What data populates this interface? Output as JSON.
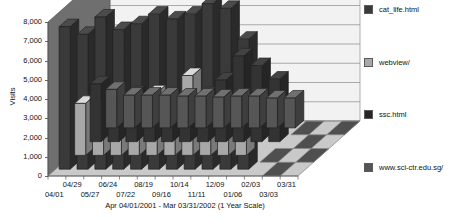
{
  "chart_data": {
    "type": "bar",
    "title": "Top Documents",
    "xlabel": "Apr 04/01/2001 - Mar 03/31/2002 (1 Year Scale)",
    "ylabel": "Visits",
    "ylim": [
      0,
      8000
    ],
    "yticks": [
      "0",
      "1,000",
      "2,000",
      "3,000",
      "4,000",
      "5,000",
      "6,000",
      "7,000",
      "8,000"
    ],
    "ytick_values": [
      0,
      1000,
      2000,
      3000,
      4000,
      5000,
      6000,
      7000,
      8000
    ],
    "grid": true,
    "legend_position": "right",
    "projection": "3d",
    "categories": [
      "04/01",
      "04/29",
      "05/27",
      "06/24",
      "07/22",
      "08/19",
      "09/16",
      "10/14",
      "11/11",
      "12/09",
      "01/06",
      "02/03",
      "03/03",
      "03/31"
    ],
    "categories_upper": [
      "04/29",
      "06/24",
      "08/19",
      "10/14",
      "12/09",
      "02/03",
      "03/31"
    ],
    "categories_lower": [
      "04/01",
      "05/27",
      "07/22",
      "09/16",
      "11/11",
      "01/06",
      "03/03"
    ],
    "series": [
      {
        "name": "cat_life.html",
        "color": "#3a3a3a",
        "values": [
          7400,
          7000,
          7900,
          7250,
          7550,
          8050,
          7800,
          8050,
          8600,
          8350,
          6750,
          0,
          0,
          0
        ]
      },
      {
        "name": "webview/",
        "color": "#a8a8a8",
        "values": [
          2700,
          2450,
          2300,
          2300,
          3250,
          2750,
          4150,
          2500,
          2800,
          1800,
          0,
          0,
          0,
          0
        ]
      },
      {
        "name": "ssc.html",
        "color": "#333333",
        "values": [
          3000,
          2050,
          2500,
          2100,
          2100,
          2100,
          2450,
          3200,
          4450,
          3950,
          3250,
          0,
          0,
          0
        ]
      },
      {
        "name": "www.sci-ctr.edu.sg/",
        "color": "#565656",
        "values": [
          2000,
          1700,
          1700,
          1700,
          1650,
          1650,
          1600,
          1650,
          1650,
          1550,
          1550,
          0,
          0,
          0
        ]
      }
    ]
  },
  "legend": {
    "items": [
      {
        "label": "cat_life.html",
        "color": "#3a3a3a"
      },
      {
        "label": "webview/",
        "color": "#a8a8a8"
      },
      {
        "label": "ssc.html",
        "color": "#262626"
      },
      {
        "label": "www.sci-ctr.edu.sg/",
        "color": "#555555"
      }
    ]
  },
  "style": {
    "wall_color": "#f2f2f2",
    "floor_color": "#c9c9c9",
    "left_wall_color": "#6f6f6f",
    "grid_color": "#8a8a8a",
    "axis_color": "#555555"
  }
}
